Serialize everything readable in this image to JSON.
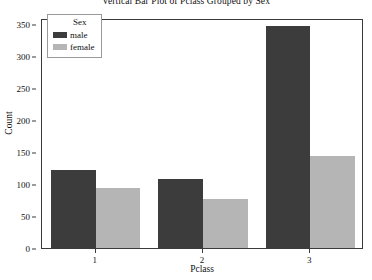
{
  "chart_data": {
    "type": "bar",
    "title": "Vertical Bar Plot of Pclass Grouped by Sex",
    "xlabel": "Pclass",
    "ylabel": "Count",
    "categories": [
      "1",
      "2",
      "3"
    ],
    "series": [
      {
        "name": "male",
        "color": "#3c3c3c",
        "values": [
          122,
          108,
          347
        ]
      },
      {
        "name": "female",
        "color": "#b5b5b5",
        "values": [
          94,
          76,
          144
        ]
      }
    ],
    "ylim": [
      0,
      360
    ],
    "yticks": [
      0,
      50,
      100,
      150,
      200,
      250,
      300,
      350
    ],
    "ytick_labels": [
      "0",
      "50",
      "100",
      "150",
      "200",
      "250",
      "300",
      "350"
    ],
    "xtick_labels": [
      "1",
      "2",
      "3"
    ],
    "grid": false,
    "legend": {
      "title": "Sex",
      "position": "upper-left",
      "entries": [
        {
          "label": "male",
          "color": "#3c3c3c"
        },
        {
          "label": "female",
          "color": "#b5b5b5"
        }
      ]
    }
  },
  "figure": {
    "background": "#ffffff",
    "frame_color": "#3a3a3a"
  }
}
